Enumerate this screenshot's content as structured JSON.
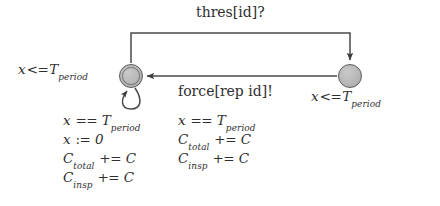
{
  "diagram": {
    "type": "timed-automaton",
    "title_text": "",
    "colors": {
      "background": "#ffffff",
      "node_fill": "#b6b6b6",
      "node_stroke": "#5a5a5a",
      "edge_stroke": "#4a4a4a",
      "text": "#2f2f2f"
    },
    "nodes": [
      {
        "id": "left",
        "name": "left-location",
        "kind": "committed",
        "cx": 131,
        "cy": 76,
        "r": 12,
        "invariant": "x <= T_period",
        "invariant_var": "x",
        "invariant_op": "<=",
        "invariant_clock": "T",
        "invariant_sub": "period"
      },
      {
        "id": "right",
        "name": "right-location",
        "kind": "normal",
        "cx": 350,
        "cy": 76,
        "r": 12,
        "invariant": "x <= T_period",
        "invariant_var": "x",
        "invariant_op": "<=",
        "invariant_clock": "T",
        "invariant_sub": "period"
      }
    ],
    "edges": [
      {
        "id": "top-edge",
        "name": "edge-left-to-right",
        "from": "left",
        "to": "right",
        "sync": "thres[id]?",
        "route": "up-over-down",
        "arrow_at": "right-node-top"
      },
      {
        "id": "back-edge",
        "name": "edge-right-to-left",
        "from": "right",
        "to": "left",
        "sync": "force[rep id]!",
        "route": "straight-horizontal",
        "arrow_at": "left-node-right"
      },
      {
        "id": "self-loop",
        "name": "edge-left-self-loop",
        "from": "left",
        "to": "left",
        "sync": "",
        "route": "loop-below",
        "arrow_at": "left-node-bottom"
      }
    ],
    "labels": {
      "top_sync": "thres[id]?",
      "mid_sync": "force[rep id]!",
      "left_invariant": {
        "var": "x",
        "op": "<=",
        "clock": "T",
        "sub": "period"
      },
      "right_invariant": {
        "var": "x",
        "op": "<=",
        "clock": "T",
        "sub": "period"
      }
    },
    "self_loop_block": {
      "name": "self-loop-guard-update",
      "lines": [
        {
          "lhs": "x",
          "op": "==",
          "rhs": "T",
          "rhs_sub": "period"
        },
        {
          "lhs": "x",
          "op": ":=",
          "rhs": "0",
          "rhs_sub": ""
        },
        {
          "lhs": "C",
          "lhs_sub": "total",
          "op": "+=",
          "rhs": "C",
          "rhs_sub": ""
        },
        {
          "lhs": "C",
          "lhs_sub": "insp",
          "op": "+=",
          "rhs": "C",
          "rhs_sub": ""
        }
      ],
      "plain": [
        "x == T_period",
        "x := 0",
        "C_total += C",
        "C_insp += C"
      ]
    },
    "back_edge_block": {
      "name": "back-edge-guard-update",
      "lines": [
        {
          "lhs": "x",
          "op": "==",
          "rhs": "T",
          "rhs_sub": "period"
        },
        {
          "lhs": "C",
          "lhs_sub": "total",
          "op": "+=",
          "rhs": "C",
          "rhs_sub": ""
        },
        {
          "lhs": "C",
          "lhs_sub": "insp",
          "op": "+=",
          "rhs": "C",
          "rhs_sub": ""
        }
      ],
      "plain": [
        "x == T_period",
        "C_total += C",
        "C_insp += C"
      ]
    }
  }
}
